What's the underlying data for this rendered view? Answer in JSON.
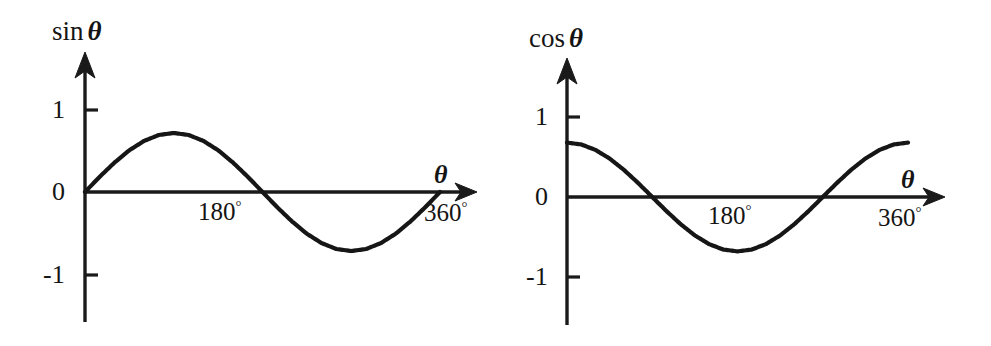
{
  "page": {
    "width": 991,
    "height": 346,
    "background": "#ffffff",
    "ink_color": "#161616"
  },
  "charts": [
    {
      "id": "sine-chart",
      "name": "sine-curve-chart",
      "y_axis_label": "sin",
      "y_axis_label_symbol": "θ",
      "x_axis_label": "θ",
      "y_ticks": [
        "1",
        "0",
        "-1"
      ],
      "x_ticks": [
        "180",
        "360"
      ],
      "degree_symbol": "°",
      "geometry": {
        "axis_x": 85,
        "axis_y": 192,
        "unit_px": 82,
        "x_start": 85,
        "x_end": 440,
        "arrow_tip_x": 477,
        "y_top": 52,
        "y_bottom": 322,
        "tick_1_y": 110,
        "tick_neg1_y": 275,
        "tick_len": 13,
        "amplitude": 0.72
      },
      "chart_data": {
        "type": "line",
        "title": "sin θ",
        "xlabel": "θ",
        "ylabel": "sin θ",
        "xlim": [
          0,
          360
        ],
        "ylim": [
          -1.3,
          1.3
        ],
        "xticks": [
          180,
          360
        ],
        "xticklabels": [
          "180°",
          "360°"
        ],
        "yticks": [
          -1,
          0,
          1
        ],
        "yticklabels": [
          "-1",
          "0",
          "1"
        ],
        "grid": false,
        "legend": false,
        "drawn_amplitude": 0.72,
        "series": [
          {
            "name": "sin θ",
            "x": [
              0,
              15,
              30,
              45,
              60,
              75,
              90,
              105,
              120,
              135,
              150,
              165,
              180,
              195,
              210,
              225,
              240,
              255,
              270,
              285,
              300,
              315,
              330,
              345,
              360
            ],
            "y": [
              0.0,
              0.259,
              0.5,
              0.707,
              0.866,
              0.966,
              1.0,
              0.966,
              0.866,
              0.707,
              0.5,
              0.259,
              0.0,
              -0.259,
              -0.5,
              -0.707,
              -0.866,
              -0.966,
              -1.0,
              -0.966,
              -0.866,
              -0.707,
              -0.5,
              -0.259,
              0.0
            ]
          }
        ],
        "annotations": [
          {
            "text": "maximum at 90°",
            "x": 90,
            "y": 1
          },
          {
            "text": "zero crossing at 180°",
            "x": 180,
            "y": 0
          },
          {
            "text": "minimum at 270°",
            "x": 270,
            "y": -1
          }
        ]
      }
    },
    {
      "id": "cosine-chart",
      "name": "cosine-curve-chart",
      "y_axis_label": "cos",
      "y_axis_label_symbol": "θ",
      "x_axis_label": "θ",
      "y_ticks": [
        "1",
        "0",
        "-1"
      ],
      "x_ticks": [
        "180",
        "360"
      ],
      "degree_symbol": "°",
      "geometry": {
        "axis_x": 567,
        "axis_y": 197,
        "unit_px": 80,
        "x_start": 567,
        "x_end": 908,
        "arrow_tip_x": 945,
        "y_top": 58,
        "y_bottom": 325,
        "tick_1_y": 117,
        "tick_neg1_y": 277,
        "tick_len": 13,
        "amplitude": 0.68
      },
      "chart_data": {
        "type": "line",
        "title": "cos θ",
        "xlabel": "θ",
        "ylabel": "cos θ",
        "xlim": [
          0,
          360
        ],
        "ylim": [
          -1.3,
          1.3
        ],
        "xticks": [
          180,
          360
        ],
        "xticklabels": [
          "180°",
          "360°"
        ],
        "yticks": [
          -1,
          0,
          1
        ],
        "yticklabels": [
          "-1",
          "0",
          "1"
        ],
        "grid": false,
        "legend": false,
        "drawn_amplitude": 0.68,
        "series": [
          {
            "name": "cos θ",
            "x": [
              0,
              15,
              30,
              45,
              60,
              75,
              90,
              105,
              120,
              135,
              150,
              165,
              180,
              195,
              210,
              225,
              240,
              255,
              270,
              285,
              300,
              315,
              330,
              345,
              360
            ],
            "y": [
              1.0,
              0.966,
              0.866,
              0.707,
              0.5,
              0.259,
              0.0,
              -0.259,
              -0.5,
              -0.707,
              -0.866,
              -0.966,
              -1.0,
              -0.966,
              -0.866,
              -0.707,
              -0.5,
              -0.259,
              0.0,
              0.259,
              0.5,
              0.707,
              0.866,
              0.966,
              1.0
            ]
          }
        ],
        "annotations": [
          {
            "text": "maximum at 0°",
            "x": 0,
            "y": 1
          },
          {
            "text": "zero crossing at 90°",
            "x": 90,
            "y": 0
          },
          {
            "text": "minimum at 180°",
            "x": 180,
            "y": -1
          },
          {
            "text": "zero crossing at 270°",
            "x": 270,
            "y": 0
          }
        ]
      }
    }
  ]
}
